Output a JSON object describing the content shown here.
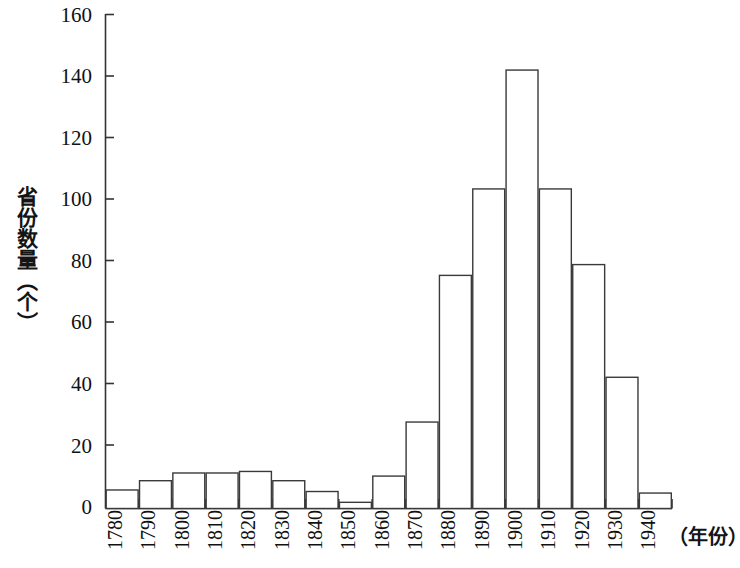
{
  "chart_data": {
    "type": "bar",
    "title": "",
    "subtitle": "",
    "xlabel": "（年份）",
    "ylabel": "省份数量（个）",
    "categories": [
      "1780",
      "1790",
      "1800",
      "1810",
      "1820",
      "1830",
      "1840",
      "1850",
      "1860",
      "1870",
      "1880",
      "1890",
      "1900",
      "1910",
      "1920",
      "1930",
      "1940"
    ],
    "values": [
      6,
      9,
      11.5,
      11.5,
      12,
      9,
      5.5,
      2,
      10.5,
      28,
      75.5,
      103.5,
      142,
      103.5,
      79,
      42.5,
      5
    ],
    "xlim": [
      1780,
      1950
    ],
    "ylim": [
      0,
      160
    ],
    "y_ticks": [
      0,
      20,
      40,
      60,
      80,
      100,
      120,
      140,
      160
    ],
    "y_tick_labels": [
      "0",
      "20",
      "40",
      "60",
      "80",
      "100",
      "120",
      "140",
      "160"
    ],
    "x_tick_labels": [
      "1780",
      "1790",
      "1800",
      "1810",
      "1820",
      "1830",
      "1840",
      "1850",
      "1860",
      "1870",
      "1880",
      "1890",
      "1900",
      "1910",
      "1920",
      "1930",
      "1940"
    ],
    "grid": false,
    "legend": null,
    "bar_style": "adjacent histogram bars, white fill with thin dark outline",
    "colors": {
      "bar_fill": "#ffffff",
      "bar_stroke": "#3a3a3a",
      "axis": "#333333",
      "text": "#111111",
      "background": "#ffffff"
    }
  }
}
